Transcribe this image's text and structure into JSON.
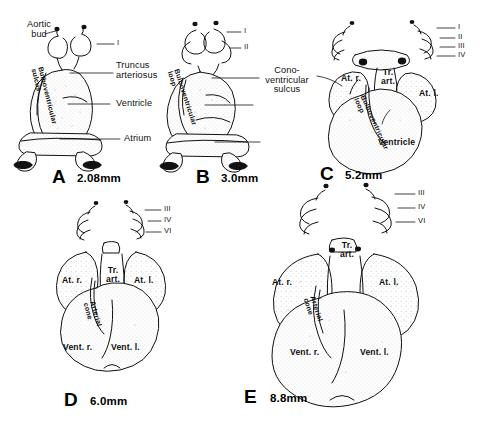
{
  "figure": {
    "background_color": "#ffffff",
    "ink_color": "#111111",
    "stipple_fill": "#f2f2f2"
  },
  "panels": [
    {
      "id": "A",
      "size": "2.08mm",
      "callouts": [
        {
          "text": "Aortic bud"
        },
        {
          "text": "Truncus arteriosus"
        },
        {
          "text": "Ventricle"
        },
        {
          "text": "Atrium"
        }
      ],
      "arches": [
        "I"
      ],
      "structures": [
        "Bulboventricular sulcus"
      ]
    },
    {
      "id": "B",
      "size": "3.0mm",
      "callouts": [],
      "arches": [
        "I",
        "II"
      ],
      "structures": [
        "Bulboventricular loop"
      ]
    },
    {
      "id": "C",
      "size": "5.2mm",
      "callouts": [
        {
          "text": "Cono-ventricular sulcus"
        }
      ],
      "arches": [
        "I",
        "II",
        "III",
        "IV"
      ],
      "structures": [
        "At. r.",
        "Tr. art.",
        "At. l.",
        "Bulboventricular loop",
        "Ventricle"
      ]
    },
    {
      "id": "D",
      "size": "6.0mm",
      "callouts": [],
      "arches": [
        "III",
        "IV",
        "VI"
      ],
      "structures": [
        "At. r.",
        "Tr. art.",
        "At. l.",
        "Arterial cone",
        "Vent. r.",
        "Vent. l."
      ]
    },
    {
      "id": "E",
      "size": "8.8mm",
      "callouts": [],
      "arches": [
        "III",
        "IV",
        "VI"
      ],
      "structures": [
        "At. r.",
        "Tr. art.",
        "At. l.",
        "Arterial cone",
        "Vent. r.",
        "Vent. l."
      ]
    }
  ],
  "labels": {
    "a_aortic_bud_l1": "Aortic",
    "a_aortic_bud_l2": "bud",
    "a_arch_1": "I",
    "a_truncus_l1": "Truncus",
    "a_truncus_l2": "arteriosus",
    "a_ventricle": "Ventricle",
    "a_atrium": "Atrium",
    "a_bulbo_sulcus_l1": "Bulboventricular",
    "a_bulbo_sulcus_l2": "sulcus",
    "b_arch_1": "I",
    "b_arch_2": "II",
    "b_bulbo_loop_l1": "Bulboventricular",
    "b_bulbo_loop_l2": "loop",
    "c_arch_1": "I",
    "c_arch_2": "II",
    "c_arch_3": "III",
    "c_arch_4": "IV",
    "c_cono_l1": "Cono-ventricular",
    "c_cono_l2": "sulcus",
    "c_at_r": "At. r.",
    "c_tr_art_l1": "Tr.",
    "c_tr_art_l2": "art.",
    "c_at_l": "At. l.",
    "c_bulbo_loop_l1": "Bulboventricular",
    "c_bulbo_loop_l2": "loop",
    "c_ventricle": "Ventricle",
    "d_arch_3": "III",
    "d_arch_4": "IV",
    "d_arch_6": "VI",
    "d_at_r": "At. r.",
    "d_tr_art_l1": "Tr.",
    "d_tr_art_l2": "art.",
    "d_at_l": "At. l.",
    "d_arterial_cone_l1": "Arterial",
    "d_arterial_cone_l2": "cone",
    "d_vent_r": "Vent. r.",
    "d_vent_l": "Vent. l.",
    "e_arch_3": "III",
    "e_arch_4": "IV",
    "e_arch_6": "VI",
    "e_at_r": "At. r.",
    "e_tr_art_l1": "Tr.",
    "e_tr_art_l2": "art.",
    "e_at_l": "At. l.",
    "e_arterial_cone_l1": "Arterial",
    "e_arterial_cone_l2": "cone",
    "e_vent_r": "Vent. r.",
    "e_vent_l": "Vent. l.",
    "panel_a_id": "A",
    "panel_a_size": "2.08mm",
    "panel_b_id": "B",
    "panel_b_size": "3.0mm",
    "panel_c_id": "C",
    "panel_c_size": "5.2mm",
    "panel_d_id": "D",
    "panel_d_size": "6.0mm",
    "panel_e_id": "E",
    "panel_e_size": "8.8mm"
  }
}
